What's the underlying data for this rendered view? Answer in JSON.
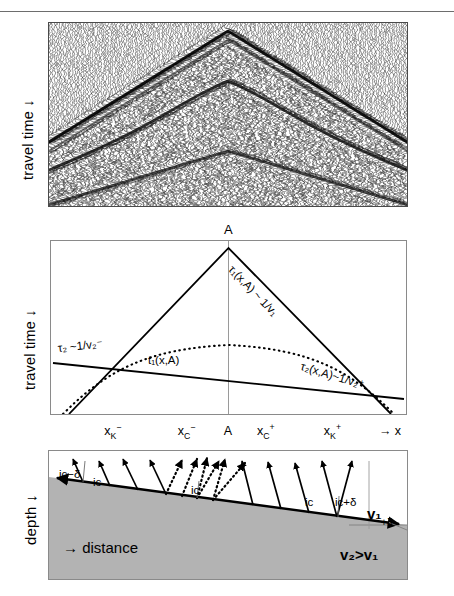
{
  "figure": {
    "domain": "scientific-diagram",
    "panels": 3,
    "width": 454,
    "height": 596
  },
  "axes": {
    "seismic_ylabel": "travel time ↓",
    "traveltime_ylabel": "travel time ↓",
    "section_ylabel": "depth ↓",
    "section_xlabel": "→ distance"
  },
  "apex": {
    "label": "A"
  },
  "xticks": [
    {
      "label_main": "x",
      "sub": "K",
      "sup": "−",
      "x_pct": 18.0
    },
    {
      "label_main": "x",
      "sub": "C",
      "sup": "−",
      "x_pct": 38.5
    },
    {
      "label_main": "A",
      "sub": "",
      "sup": "",
      "x_pct": 50.0
    },
    {
      "label_main": "x",
      "sub": "C",
      "sup": "+",
      "x_pct": 60.5
    },
    {
      "label_main": "x",
      "sub": "K",
      "sup": "+",
      "x_pct": 79.0
    },
    {
      "label_main": "→ x",
      "sub": "",
      "sup": "",
      "x_pct": 95.0
    }
  ],
  "traveltime_labels": {
    "tau2_minus": "τ₂ ~1/v₂⁻",
    "tau1": "τ₁(x,A) ~ 1/v₁",
    "tau2_plus": "τ₂(x,A)~1/v₂⁺",
    "t1": "t₁(x,A)"
  },
  "section_labels": {
    "ic_minus_delta": "iᴄ−δ",
    "ic_left": "iᴄ",
    "ic_center": "iᴄ",
    "ic_right": "iᴄ",
    "ic_plus_delta": "iᴄ+δ",
    "v1": "v₁",
    "v2_gt_v1": "v₂>v₁",
    "dip": "+δ"
  },
  "colors": {
    "ink": "#000000",
    "frame": "#8a8a8a",
    "frame_dark": "#4a4a4a",
    "halfspace_fill": "#b3b3b3",
    "rule": "#6d6d6d",
    "paper": "#ffffff"
  },
  "chart_data": {
    "type": "line",
    "panels": [
      {
        "id": "seismic-record-section",
        "type": "heatmap",
        "title": "",
        "xlabel": "",
        "ylabel": "travel time ↓",
        "description": "Wiggle-trace seismic record section with a chevron-shaped first-break apex near the centre and a second, deeper reflection branch below it.",
        "apex_x_pct": 50,
        "grid": false
      },
      {
        "id": "travel-time-curves",
        "type": "line",
        "title": "",
        "xlabel": "x",
        "ylabel": "travel time ↓",
        "xlim": [
          0,
          100
        ],
        "ylim": [
          0,
          100
        ],
        "grid": false,
        "note": "y axis increases downward (travel time), so curves drawn as inverted peaks",
        "series": [
          {
            "name": "τ₁(x,A) ~ 1/v₁",
            "style": "solid",
            "points": [
              [
                50,
                96
              ],
              [
                100,
                4
              ]
            ],
            "slope_sign": "negative",
            "comment": "right limb of direct-wave chevron"
          },
          {
            "name": "τ₁(x,A) ~ 1/v₁ left limb",
            "style": "solid",
            "points": [
              [
                0,
                2
              ],
              [
                50,
                96
              ]
            ],
            "slope_sign": "positive"
          },
          {
            "name": "τ₂ ~1/v₂⁻",
            "style": "solid",
            "points": [
              [
                0,
                38
              ],
              [
                100,
                66
              ]
            ],
            "comment": "shallow-dipping refraction line, updip side"
          },
          {
            "name": "τ₂(x,A)~1/v₂⁺",
            "style": "solid",
            "points": [
              [
                0,
                66
              ],
              [
                100,
                38
              ]
            ],
            "comment": "shallow-dipping refraction line, downdip side"
          },
          {
            "name": "t₁(x,A)",
            "style": "dotted",
            "points": [
              [
                2,
                4
              ],
              [
                12,
                34
              ],
              [
                25,
                55
              ],
              [
                38,
                66
              ],
              [
                50,
                69
              ],
              [
                62,
                66
              ],
              [
                75,
                55
              ],
              [
                88,
                34
              ],
              [
                98,
                4
              ]
            ],
            "comment": "reflection hyperbola, apex at A"
          }
        ]
      },
      {
        "id": "cross-section",
        "type": "diagram",
        "title": "",
        "xlabel": "→ distance",
        "ylabel": "depth ↓",
        "layers": [
          {
            "name": "upper layer",
            "velocity_label": "v₁",
            "fill": "#ffffff"
          },
          {
            "name": "lower half-space",
            "velocity_label": "v₂>v₁",
            "fill": "#b3b3b3"
          }
        ],
        "interface": {
          "dip_label": "+δ",
          "left_depth_pct": 20,
          "right_depth_pct": 58,
          "description": "planar interface dipping to the right by angle delta"
        },
        "rays": {
          "solid_count": 9,
          "dotted_count": 6,
          "angle_labels": [
            "iᴄ−δ",
            "iᴄ",
            "iᴄ",
            "iᴄ",
            "iᴄ+δ"
          ],
          "description": "head-wave ray paths leaving the refractor at the critical angle; dotted rays cluster near source point A"
        }
      }
    ]
  }
}
